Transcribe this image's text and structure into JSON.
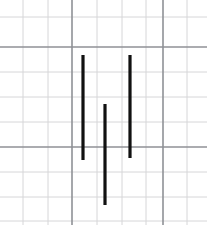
{
  "figure": {
    "width": 207,
    "height": 225,
    "background_color": "#ffffff"
  },
  "grid": {
    "paper_type": "graph-paper",
    "cell_size": 25,
    "minor_color": "#d6d6d8",
    "major_color": "#8f9196",
    "minor_vertical_x": [
      23,
      48,
      97,
      122,
      146,
      187
    ],
    "minor_horizontal_y": [
      17,
      72,
      97,
      122,
      172,
      197,
      221
    ],
    "major_vertical_x": [
      72,
      163
    ],
    "major_horizontal_y": [
      47,
      147
    ]
  },
  "chart_data": {
    "type": "line",
    "xlabel": "",
    "ylabel": "",
    "xlim": [
      0,
      207
    ],
    "ylim": [
      225,
      0
    ],
    "grid": true,
    "legend": "none",
    "series": [
      {
        "name": "stroke-left",
        "color": "#111111",
        "width": 3.2,
        "x": [
          83,
          83
        ],
        "y": [
          55,
          160
        ]
      },
      {
        "name": "stroke-middle",
        "color": "#111111",
        "width": 3.2,
        "x": [
          105,
          105
        ],
        "y": [
          104,
          205
        ]
      },
      {
        "name": "stroke-right",
        "color": "#111111",
        "width": 3.2,
        "x": [
          130,
          130
        ],
        "y": [
          55,
          158
        ]
      }
    ]
  },
  "strokes": [
    {
      "label": "stroke-left",
      "x": 83,
      "y_top": 55,
      "y_bottom": 160,
      "color": "#111111",
      "thickness": 3.2
    },
    {
      "label": "stroke-middle",
      "x": 105,
      "y_top": 104,
      "y_bottom": 205,
      "color": "#111111",
      "thickness": 3.2
    },
    {
      "label": "stroke-right",
      "x": 130,
      "y_top": 55,
      "y_bottom": 158,
      "color": "#111111",
      "thickness": 3.2
    }
  ]
}
